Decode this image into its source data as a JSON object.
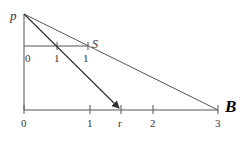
{
  "diagram": {
    "point_p": {
      "label": "p",
      "x": 24,
      "y": 14
    },
    "upper_segment": {
      "y": 46,
      "x_start": 24,
      "x_end": 88,
      "ticks": [
        {
          "label": "0",
          "x": 24
        },
        {
          "label": "1",
          "x": 57
        },
        {
          "label": "1",
          "x": 88
        }
      ],
      "end_label": "S"
    },
    "lower_axis": {
      "y": 110,
      "x_start": 24,
      "x_end": 218,
      "ticks": [
        {
          "label": "0",
          "x": 24
        },
        {
          "label": "1",
          "x": 90
        },
        {
          "label": "r",
          "x": 121
        },
        {
          "label": "2",
          "x": 153
        },
        {
          "label": "3",
          "x": 218
        }
      ],
      "end_label": "B"
    },
    "lines": [
      {
        "name": "p-to-B",
        "from": [
          24,
          14
        ],
        "to": [
          218,
          110
        ],
        "arrow": false
      },
      {
        "name": "p-to-r",
        "from": [
          24,
          14
        ],
        "to": [
          121,
          110
        ],
        "arrow": true
      }
    ],
    "colors": {
      "stroke": "#555555",
      "text": "#333333",
      "bold_label": "#000000"
    }
  }
}
